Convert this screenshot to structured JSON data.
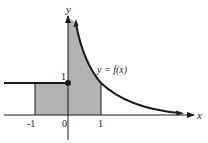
{
  "figure": {
    "axes": {
      "x_label": "x",
      "y_label": "y",
      "x_ticks": [
        "-1",
        "0",
        "1"
      ],
      "y_ticks": [
        "1"
      ]
    },
    "curve_label": "y = f(x)",
    "point": {
      "x": 0,
      "y": 1,
      "filled": true
    },
    "shaded_region": {
      "x_from": -1,
      "x_to": 1
    },
    "colors": {
      "shade": "#b3b3b3",
      "ink": "#1a1a1a",
      "background": "#ffffff"
    }
  }
}
